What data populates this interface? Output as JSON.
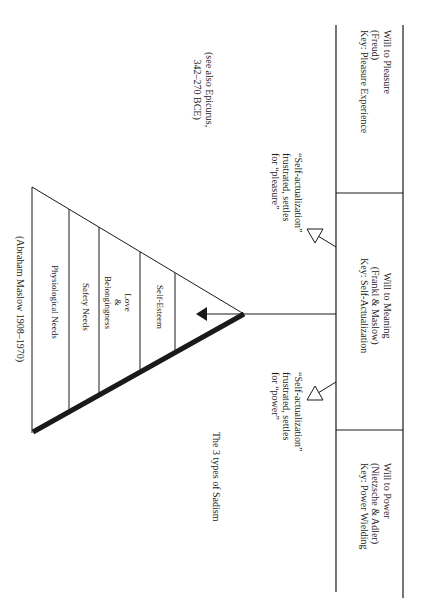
{
  "orientation": "rotated 90deg clockwise",
  "columns": [
    {
      "title": "Will to Pleasure",
      "source": "(Freud)",
      "key": "Key: Pleasure Experience"
    },
    {
      "title": "Will to Meaning",
      "source": "(Frankl & Maslow)",
      "key": "Key: Self-Actualization"
    },
    {
      "title": "Will to Power",
      "source": "(Nietzsche & Adler)",
      "key": "Key: Power Wielding"
    }
  ],
  "notes": {
    "epicurus": [
      "(see also Epicurus,",
      "342–270 BCE)"
    ],
    "pleasure_arrow": [
      "“Self-actualization”",
      "frustrated, settles",
      "for “pleasure”"
    ],
    "power_arrow": [
      "“Self-actualization”",
      "frustrated, settles",
      "for “power”"
    ],
    "sadism": "The 3 types of Sadism"
  },
  "pyramid": {
    "levels": [
      {
        "label": "Self-Esteem"
      },
      {
        "label": "Love\n&\nBelongingness",
        "lines": [
          "Love",
          "&",
          "Belongingness"
        ]
      },
      {
        "label": "Safety Needs"
      },
      {
        "label": "Physiological Needs"
      }
    ],
    "attribution": "(Abraham Maslow 1908–1970)"
  },
  "colors": {
    "line": "#1a1a1a",
    "background": "#ffffff"
  }
}
